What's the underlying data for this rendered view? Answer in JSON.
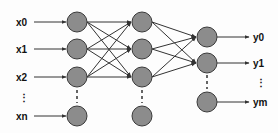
{
  "diagram": {
    "colors": {
      "node_fill": "#8c8c8c",
      "node_stroke": "#3a3a3a",
      "edge": "#333333",
      "text": "#111111"
    },
    "inputs": [
      {
        "label": "x0",
        "y": 22
      },
      {
        "label": "x1",
        "y": 49
      },
      {
        "label": "x2",
        "y": 77
      },
      {
        "label": "xn",
        "y": 116
      }
    ],
    "input_ellipsis": "⋮",
    "outputs": [
      {
        "label": "y0",
        "y": 37
      },
      {
        "label": "y1",
        "y": 63
      },
      {
        "label": "ym",
        "y": 102
      }
    ],
    "output_ellipsis": "⋮",
    "layers": [
      {
        "name": "input-layer",
        "x": 77,
        "nodes_y": [
          22,
          49,
          77,
          116
        ]
      },
      {
        "name": "hidden-layer",
        "x": 142,
        "nodes_y": [
          22,
          49,
          77,
          116
        ]
      },
      {
        "name": "output-layer",
        "x": 207,
        "nodes_y": [
          37,
          63,
          102
        ]
      }
    ]
  }
}
